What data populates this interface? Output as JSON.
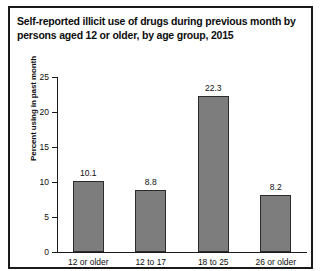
{
  "chart_data": {
    "type": "bar",
    "title": "Self-reported illicit use of drugs during previous month by persons aged 12 or older, by age group, 2015",
    "categories": [
      "12 or older",
      "12 to 17",
      "18 to 25",
      "26 or older"
    ],
    "values": [
      10.1,
      8.8,
      22.3,
      8.2
    ],
    "value_labels": [
      "10.1",
      "8.8",
      "22.3",
      "8.2"
    ],
    "xlabel": "",
    "ylabel": "Percent using in past month",
    "ylim": [
      0,
      25
    ],
    "y_ticks": [
      0,
      5,
      10,
      15,
      20,
      25
    ],
    "y_tick_labels": [
      "0",
      "5",
      "10",
      "15",
      "20",
      "25"
    ],
    "grid": false,
    "legend": false,
    "colors": {
      "bar_fill": "#7d7d7d",
      "bar_border": "#2b2b2b",
      "axis": "#1a1a1a",
      "text": "#0d0d0d",
      "frame": "#1a1a1a",
      "background": "#ffffff"
    }
  }
}
